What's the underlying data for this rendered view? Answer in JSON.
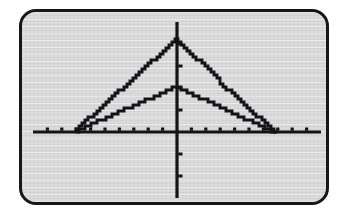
{
  "device": {
    "screen_kind": "graphing-calculator-lcd",
    "bezel_color": "#17161a",
    "lcd_background": "#dcdcdc",
    "ink_color": "#141318"
  },
  "chart_data": {
    "type": "line",
    "title": "",
    "subtitle": "",
    "xlabel": "",
    "ylabel": "",
    "grid": false,
    "legend": null,
    "axes": {
      "x_axis_shown": true,
      "y_axis_shown": true,
      "xlim": [
        -10,
        10
      ],
      "ylim": [
        -6,
        10
      ],
      "x_tick_step": 1,
      "y_tick_step": 2,
      "x_tick_values": [
        -9,
        -8,
        -7,
        -6,
        -5,
        -4,
        -3,
        -2,
        -1,
        1,
        2,
        3,
        4,
        5,
        6,
        7,
        8,
        9
      ],
      "y_tick_values": [
        2,
        4,
        6,
        8,
        -2,
        -4
      ],
      "origin_label": "0"
    },
    "series": [
      {
        "name": "Y1",
        "description": "tall triangular absolute-value graph, apex on y-axis",
        "style": "pixelated-dotted-line",
        "x": [
          -7.0,
          0.0,
          7.0
        ],
        "y": [
          0.0,
          8.4,
          0.0
        ],
        "vertex": {
          "x": 0.0,
          "y": 8.4
        },
        "x_intercepts": [
          -7.0,
          7.0
        ],
        "y_intercept": 8.4,
        "left_slope": 1.2,
        "right_slope": -1.2
      },
      {
        "name": "Y2",
        "description": "short triangular absolute-value graph, apex on y-axis",
        "style": "pixelated-dotted-line",
        "x": [
          -7.0,
          0.0,
          7.0
        ],
        "y": [
          0.0,
          4.1,
          0.0
        ],
        "vertex": {
          "x": 0.0,
          "y": 4.1
        },
        "x_intercepts": [
          -7.0,
          7.0
        ],
        "y_intercept": 4.1,
        "left_slope": 0.59,
        "right_slope": -0.59
      }
    ]
  }
}
